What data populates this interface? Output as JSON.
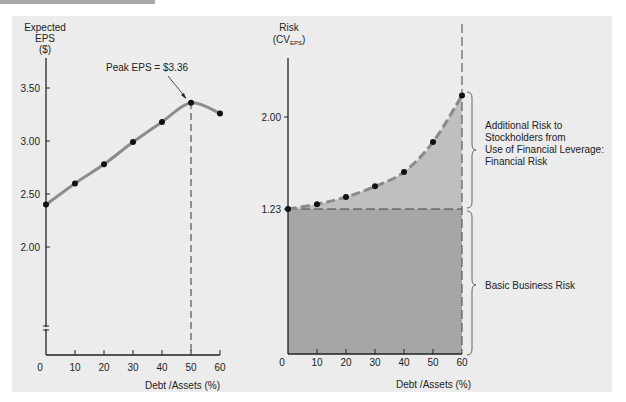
{
  "chart_data": [
    {
      "type": "line",
      "title": "",
      "ylabel_lines": [
        "Expected",
        "EPS",
        "($)"
      ],
      "xlabel": "Debt /Assets (%)",
      "x": [
        0,
        10,
        20,
        30,
        40,
        50,
        60
      ],
      "x_ticks": [
        "0",
        "10",
        "20",
        "30",
        "40",
        "50",
        "60"
      ],
      "y_ticks": [
        "3.50",
        "3.00",
        "2.50",
        "2.00"
      ],
      "ylim": [
        1.9,
        3.6
      ],
      "series": [
        {
          "name": "Expected EPS",
          "values": [
            2.4,
            2.6,
            2.78,
            2.99,
            3.18,
            3.36,
            3.26
          ]
        }
      ],
      "annotations": [
        {
          "text": "Peak EPS = $3.36",
          "x": 50,
          "y": 3.36
        }
      ],
      "axis_break": true,
      "grid": false
    },
    {
      "type": "area",
      "ylabel": "Risk",
      "ylabel_sub_prefix": "(CV",
      "ylabel_sub": "EPS",
      "ylabel_sub_suffix": ")",
      "xlabel": "Debt /Assets (%)",
      "x": [
        0,
        10,
        20,
        30,
        40,
        50,
        60
      ],
      "x_ticks": [
        "0",
        "10",
        "20",
        "30",
        "40",
        "50",
        "60"
      ],
      "y_ticks": [
        "2.00",
        "1.23"
      ],
      "series": [
        {
          "name": "Risk (CV EPS)",
          "values": [
            1.23,
            1.27,
            1.33,
            1.42,
            1.54,
            1.79,
            2.18
          ]
        }
      ],
      "baseline": 1.23,
      "regions": [
        {
          "name": "Financial Risk",
          "label_lines": [
            "Additional Risk to",
            "Stockholders from",
            "Use of Financial Leverage:",
            "Financial Risk"
          ],
          "color": "#bfbfbf"
        },
        {
          "name": "Basic Business Risk",
          "label_lines": [
            "Basic Business Risk"
          ],
          "color": "#a6a6a6"
        }
      ],
      "grid": false
    }
  ],
  "colors": {
    "panel": "#ececec",
    "line": "#8c8c8c",
    "point": "#111111",
    "financial_risk_fill": "#bfbfbf",
    "business_risk_fill": "#a6a6a6"
  }
}
